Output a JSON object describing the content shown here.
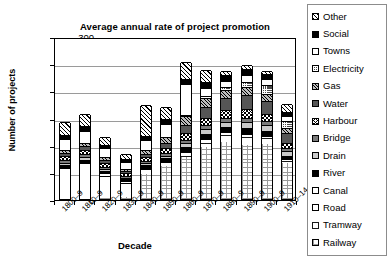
{
  "chart_data": {
    "type": "bar",
    "stacked": true,
    "title": "Average annual rate of project promotion",
    "xlabel": "Decade",
    "ylabel": "Number of projects",
    "ylim": [
      0,
      300
    ],
    "yticks": [
      0,
      50,
      100,
      150,
      200,
      250,
      300
    ],
    "grid": true,
    "legend_position": "right",
    "categories": [
      "1800–9",
      "1810–9",
      "1820–9",
      "1830–9",
      "1840–9",
      "1850–9",
      "1860–9",
      "1870–9",
      "1880–9",
      "1890–9",
      "1900–9",
      "1910–14"
    ],
    "legend_order_top_to_bottom": [
      "Other",
      "Social",
      "Towns",
      "Electricity",
      "Gas",
      "Water",
      "Harbour",
      "Bridge",
      "Drain",
      "River",
      "Canal",
      "Road",
      "Tramway",
      "Railway"
    ],
    "series": [
      {
        "name": "Railway",
        "pattern": "p-ldot",
        "values": [
          0,
          0,
          1,
          4,
          46,
          60,
          78,
          96,
          105,
          100,
          102,
          66
        ]
      },
      {
        "name": "Tramway",
        "pattern": "p-dots",
        "values": [
          0,
          0,
          0,
          0,
          0,
          0,
          2,
          8,
          12,
          14,
          10,
          4
        ]
      },
      {
        "name": "Road",
        "pattern": "p-white",
        "values": [
          52,
          60,
          41,
          26,
          10,
          8,
          6,
          6,
          6,
          5,
          4,
          3
        ]
      },
      {
        "name": "Canal",
        "pattern": "p-white",
        "values": [
          6,
          7,
          5,
          3,
          2,
          2,
          2,
          2,
          2,
          2,
          2,
          1
        ]
      },
      {
        "name": "River",
        "pattern": "p-black",
        "values": [
          5,
          5,
          4,
          3,
          4,
          5,
          7,
          8,
          7,
          9,
          8,
          6
        ]
      },
      {
        "name": "Drain",
        "pattern": "p-lgray",
        "values": [
          4,
          5,
          4,
          3,
          4,
          5,
          8,
          9,
          10,
          12,
          11,
          8
        ]
      },
      {
        "name": "Bridge",
        "pattern": "p-gray",
        "values": [
          4,
          5,
          4,
          3,
          4,
          5,
          6,
          7,
          7,
          8,
          7,
          5
        ]
      },
      {
        "name": "Harbour",
        "pattern": "p-cross",
        "values": [
          8,
          9,
          7,
          5,
          7,
          9,
          12,
          13,
          14,
          15,
          13,
          10
        ]
      },
      {
        "name": "Water",
        "pattern": "p-dgray",
        "values": [
          5,
          6,
          5,
          4,
          6,
          9,
          16,
          20,
          22,
          26,
          24,
          18
        ]
      },
      {
        "name": "Gas",
        "pattern": "p-spek",
        "values": [
          6,
          7,
          6,
          5,
          8,
          11,
          16,
          17,
          16,
          15,
          13,
          9
        ]
      },
      {
        "name": "Electricity",
        "pattern": "p-dcheck",
        "values": [
          0,
          0,
          0,
          0,
          0,
          0,
          2,
          4,
          6,
          10,
          16,
          14
        ]
      },
      {
        "name": "Towns",
        "pattern": "p-white",
        "values": [
          20,
          22,
          16,
          12,
          18,
          24,
          56,
          14,
          10,
          12,
          10,
          9
        ]
      },
      {
        "name": "Social",
        "pattern": "p-black",
        "values": [
          8,
          9,
          7,
          5,
          7,
          9,
          10,
          11,
          11,
          12,
          10,
          8
        ]
      },
      {
        "name": "Other",
        "pattern": "p-diag",
        "values": [
          23,
          22,
          14,
          10,
          57,
          22,
          31,
          23,
          7,
          7,
          6,
          14
        ]
      }
    ],
    "totals": [
      141,
      157,
      114,
      83,
      173,
      169,
      252,
      238,
      235,
      247,
      236,
      175
    ]
  }
}
